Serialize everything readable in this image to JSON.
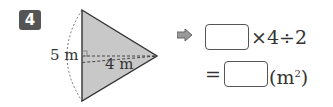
{
  "problem": {
    "number": "4",
    "figure": {
      "height_label": "5 m",
      "base_label": "4 m",
      "fill_color": "#c8c8c8"
    },
    "equation": {
      "line1_ops": "×4÷2",
      "line2_eq": "=",
      "line2_unit": "(m",
      "line2_exp": "2",
      "line2_close": ")"
    }
  }
}
